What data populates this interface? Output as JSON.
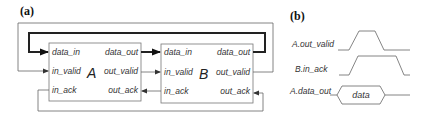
{
  "panel_a": {
    "label": "(a)",
    "block_a": {
      "name": "A",
      "ports": {
        "data_in": "data_in",
        "in_valid": "in_valid",
        "in_ack": "in_ack",
        "data_out": "data_out",
        "out_valid": "out_valid",
        "out_ack": "out_ack"
      }
    },
    "block_b": {
      "name": "B",
      "ports": {
        "data_in": "data_in",
        "in_valid": "in_valid",
        "in_ack": "in_ack",
        "data_out": "data_out",
        "out_valid": "out_valid",
        "out_ack": "out_ack"
      }
    }
  },
  "panel_b": {
    "label": "(b)",
    "signals": [
      {
        "name": "A.out_valid"
      },
      {
        "name": "B.in_ack"
      },
      {
        "name": "A.data_out",
        "bus_label": "data"
      }
    ]
  },
  "colors": {
    "line": "#555555",
    "thick": "#222222",
    "box": "#777777"
  }
}
